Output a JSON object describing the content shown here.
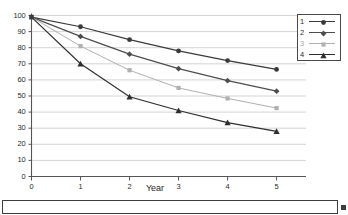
{
  "chart_data": {
    "type": "line",
    "title": "",
    "subtitle": "",
    "xlabel": "Year",
    "ylabel": "",
    "x": [
      0,
      1,
      2,
      3,
      4,
      5
    ],
    "xtick_labels": [
      "0",
      "1",
      "2",
      "3",
      "4",
      "5"
    ],
    "ytick_labels": [
      "0",
      "10",
      "20",
      "30",
      "40",
      "50",
      "60",
      "70",
      "80",
      "90",
      "100"
    ],
    "yticks": [
      0,
      10,
      20,
      30,
      40,
      50,
      60,
      70,
      80,
      90,
      100
    ],
    "xlim": [
      0,
      5.6
    ],
    "ylim": [
      0,
      100
    ],
    "grid": "horizontal",
    "legend_position": "top-right",
    "series": [
      {
        "name": "1",
        "marker": "circle",
        "color": "#3a3a3a",
        "values": [
          99,
          93,
          85,
          78,
          72,
          66.5
        ]
      },
      {
        "name": "2",
        "marker": "diamond",
        "color": "#4d4d4d",
        "values": [
          99,
          87,
          76,
          67,
          59.5,
          53
        ]
      },
      {
        "name": "3",
        "marker": "square",
        "color": "#b0b0b0",
        "values": [
          99,
          81,
          66,
          55,
          48.5,
          42.5
        ]
      },
      {
        "name": "4",
        "marker": "triangle",
        "color": "#2e2e2e",
        "values": [
          99,
          70,
          49.5,
          41,
          33.5,
          28
        ]
      }
    ]
  },
  "legend": {
    "entries": [
      {
        "label": "1"
      },
      {
        "label": "2"
      },
      {
        "label": "3"
      },
      {
        "label": "4"
      }
    ]
  },
  "axis": {
    "x_title": "Year"
  },
  "colors": {
    "axis": "#555555",
    "grid": "#c9c9c9",
    "text": "#2b2b2b",
    "frame": "#3d3d3d"
  }
}
